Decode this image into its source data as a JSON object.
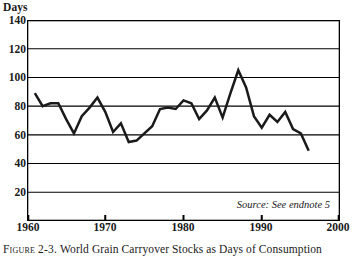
{
  "figure": {
    "y_unit_label": "Days",
    "source_note": "Source: See endnote 5",
    "caption_label": "Figure 2-3.",
    "caption_text": "World Grain Carryover Stocks as Days of Consumption",
    "line_color": "#1a1a1a",
    "frame_color": "#000000",
    "grid_color": "#000000",
    "background_color": "#ffffff"
  },
  "chart_data": {
    "type": "line",
    "title": "World Grain Carryover Stocks as Days of Consumption",
    "xlabel": "",
    "ylabel": "Days",
    "xlim": [
      1960,
      2000
    ],
    "ylim": [
      0,
      140
    ],
    "xticks": [
      1960,
      1970,
      1980,
      1990,
      2000
    ],
    "yticks": [
      20,
      40,
      60,
      80,
      100,
      120,
      140
    ],
    "grid": "horizontal",
    "legend": "none",
    "annotations": [
      "Source: See endnote 5"
    ],
    "x": [
      1961,
      1962,
      1963,
      1964,
      1965,
      1966,
      1967,
      1968,
      1969,
      1970,
      1971,
      1972,
      1973,
      1974,
      1975,
      1976,
      1977,
      1978,
      1979,
      1980,
      1981,
      1982,
      1983,
      1984,
      1985,
      1986,
      1987,
      1988,
      1989,
      1990,
      1991,
      1992,
      1993,
      1994,
      1995,
      1996
    ],
    "values": [
      89,
      80,
      82,
      82,
      71,
      61,
      73,
      79,
      86,
      76,
      62,
      68,
      55,
      56,
      61,
      66,
      78,
      79,
      78,
      84,
      82,
      71,
      77,
      86,
      72,
      89,
      105,
      93,
      73,
      65,
      74,
      69,
      76,
      64,
      61,
      49
    ]
  }
}
